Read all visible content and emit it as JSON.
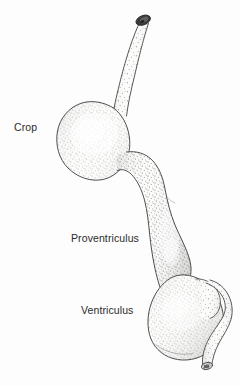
{
  "figure": {
    "background_color": "#ffffff",
    "ink_color": "#2b2b2b",
    "fill_color": "#fbfbfa",
    "cut_end_color": "#3a3a3a",
    "style": "stippled line drawing"
  },
  "labels": {
    "crop": "Crop",
    "proventriculus": "Proventriculus",
    "ventriculus": "Ventriculus"
  },
  "structures": [
    {
      "name": "esophagus",
      "label": "",
      "note": "tube entering from upper right with dark cut end"
    },
    {
      "name": "crop",
      "label": "Crop",
      "note": "large rounded sac upper left"
    },
    {
      "name": "proventriculus",
      "label": "Proventriculus",
      "note": "elongated spindle connecting crop to gizzard"
    },
    {
      "name": "ventriculus",
      "label": "Ventriculus",
      "note": "large rounded gizzard lower right"
    },
    {
      "name": "duodenum",
      "label": "",
      "note": "intestine looping from gizzard with dark cut end"
    }
  ]
}
